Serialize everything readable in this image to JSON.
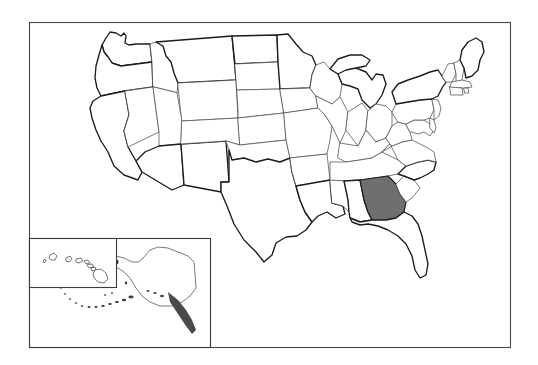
{
  "figure": {
    "type": "choropleth-locator-map",
    "projection_note": "Contiguous United States with Alaska and Hawaii insets",
    "background_color": "#ffffff",
    "frame": {
      "visible": true,
      "border_color": "#4a4a4a",
      "x": 29,
      "y": 22,
      "width": 482,
      "height": 326
    }
  },
  "legend": {
    "visible": false,
    "entries": [
      {
        "label": "Highlighted state",
        "color": "#6f6f6f"
      },
      {
        "label": "Other states",
        "color": "#ffffff"
      }
    ]
  },
  "highlight": {
    "state_name": "Georgia",
    "postal_code": "GA",
    "fill_color": "#6f6f6f",
    "outline_color": "#1c1c1c",
    "count": 1
  },
  "styling": {
    "state_fill": "#ffffff",
    "state_border": "#4d4d4d",
    "national_border": "#1c1c1c",
    "inset_border": "#3a3a3a"
  },
  "insets": [
    {
      "id": "alaska-inset",
      "label": "Alaska",
      "postal_code": "AK",
      "x": 29,
      "y": 238,
      "width": 182,
      "height": 110,
      "border_visible": true
    },
    {
      "id": "hawaii-inset",
      "label": "Hawaii",
      "postal_code": "HI",
      "x": 29,
      "y": 238,
      "width": 88,
      "height": 50,
      "border_visible": true,
      "island_count": 8
    }
  ],
  "states": [
    {
      "code": "WA",
      "name": "Washington",
      "highlighted": false
    },
    {
      "code": "OR",
      "name": "Oregon",
      "highlighted": false
    },
    {
      "code": "CA",
      "name": "California",
      "highlighted": false
    },
    {
      "code": "NV",
      "name": "Nevada",
      "highlighted": false
    },
    {
      "code": "ID",
      "name": "Idaho",
      "highlighted": false
    },
    {
      "code": "MT",
      "name": "Montana",
      "highlighted": false
    },
    {
      "code": "WY",
      "name": "Wyoming",
      "highlighted": false
    },
    {
      "code": "UT",
      "name": "Utah",
      "highlighted": false
    },
    {
      "code": "AZ",
      "name": "Arizona",
      "highlighted": false
    },
    {
      "code": "NM",
      "name": "New Mexico",
      "highlighted": false
    },
    {
      "code": "CO",
      "name": "Colorado",
      "highlighted": false
    },
    {
      "code": "ND",
      "name": "North Dakota",
      "highlighted": false
    },
    {
      "code": "SD",
      "name": "South Dakota",
      "highlighted": false
    },
    {
      "code": "NE",
      "name": "Nebraska",
      "highlighted": false
    },
    {
      "code": "KS",
      "name": "Kansas",
      "highlighted": false
    },
    {
      "code": "OK",
      "name": "Oklahoma",
      "highlighted": false
    },
    {
      "code": "TX",
      "name": "Texas",
      "highlighted": false
    },
    {
      "code": "MN",
      "name": "Minnesota",
      "highlighted": false
    },
    {
      "code": "IA",
      "name": "Iowa",
      "highlighted": false
    },
    {
      "code": "MO",
      "name": "Missouri",
      "highlighted": false
    },
    {
      "code": "AR",
      "name": "Arkansas",
      "highlighted": false
    },
    {
      "code": "LA",
      "name": "Louisiana",
      "highlighted": false
    },
    {
      "code": "WI",
      "name": "Wisconsin",
      "highlighted": false
    },
    {
      "code": "IL",
      "name": "Illinois",
      "highlighted": false
    },
    {
      "code": "MI",
      "name": "Michigan",
      "highlighted": false
    },
    {
      "code": "IN",
      "name": "Indiana",
      "highlighted": false
    },
    {
      "code": "OH",
      "name": "Ohio",
      "highlighted": false
    },
    {
      "code": "KY",
      "name": "Kentucky",
      "highlighted": false
    },
    {
      "code": "TN",
      "name": "Tennessee",
      "highlighted": false
    },
    {
      "code": "MS",
      "name": "Mississippi",
      "highlighted": false
    },
    {
      "code": "AL",
      "name": "Alabama",
      "highlighted": false
    },
    {
      "code": "GA",
      "name": "Georgia",
      "highlighted": true
    },
    {
      "code": "FL",
      "name": "Florida",
      "highlighted": false
    },
    {
      "code": "SC",
      "name": "South Carolina",
      "highlighted": false
    },
    {
      "code": "NC",
      "name": "North Carolina",
      "highlighted": false
    },
    {
      "code": "VA",
      "name": "Virginia",
      "highlighted": false
    },
    {
      "code": "WV",
      "name": "West Virginia",
      "highlighted": false
    },
    {
      "code": "MD",
      "name": "Maryland",
      "highlighted": false
    },
    {
      "code": "DE",
      "name": "Delaware",
      "highlighted": false
    },
    {
      "code": "PA",
      "name": "Pennsylvania",
      "highlighted": false
    },
    {
      "code": "NJ",
      "name": "New Jersey",
      "highlighted": false
    },
    {
      "code": "NY",
      "name": "New York",
      "highlighted": false
    },
    {
      "code": "CT",
      "name": "Connecticut",
      "highlighted": false
    },
    {
      "code": "RI",
      "name": "Rhode Island",
      "highlighted": false
    },
    {
      "code": "MA",
      "name": "Massachusetts",
      "highlighted": false
    },
    {
      "code": "VT",
      "name": "Vermont",
      "highlighted": false
    },
    {
      "code": "NH",
      "name": "New Hampshire",
      "highlighted": false
    },
    {
      "code": "ME",
      "name": "Maine",
      "highlighted": false
    },
    {
      "code": "AK",
      "name": "Alaska",
      "highlighted": false
    },
    {
      "code": "HI",
      "name": "Hawaii",
      "highlighted": false
    }
  ]
}
